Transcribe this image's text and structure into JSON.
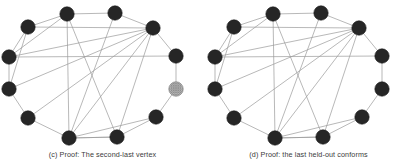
{
  "figure": {
    "type": "graph-pair-diagram",
    "background_color": "#ffffff",
    "panel_count": 2
  },
  "style": {
    "node_fill": "#262626",
    "node_stroke": "#1a1a1a",
    "highlight_node_fill": "#b5b5b5",
    "highlight_node_stroke": "#8c8c8c",
    "edge_color": "#9a9a9a",
    "edge_width": 0.7,
    "node_radius": 7.2,
    "caption_color": "#3b3b3b"
  },
  "panels": [
    {
      "id": "panel-c",
      "caption": "(c) Proof: The second-last vertex",
      "highlight_node_index": 9,
      "node_labels": [
        "v1",
        "v2",
        "v3",
        "v4",
        "v5",
        "v6",
        "v7",
        "v8",
        "v9",
        "v10",
        "v11",
        "v12"
      ],
      "nodes": [
        {
          "id": 0,
          "x": 67,
          "y": 14,
          "state": "dark"
        },
        {
          "id": 1,
          "x": 115,
          "y": 13,
          "state": "dark"
        },
        {
          "id": 2,
          "x": 153,
          "y": 28,
          "state": "dark"
        },
        {
          "id": 3,
          "x": 176,
          "y": 56,
          "state": "dark"
        },
        {
          "id": 4,
          "x": 176,
          "y": 89,
          "state": "highlight"
        },
        {
          "id": 5,
          "x": 156,
          "y": 117,
          "state": "dark"
        },
        {
          "id": 6,
          "x": 117,
          "y": 137,
          "state": "dark"
        },
        {
          "id": 7,
          "x": 69,
          "y": 138,
          "state": "dark"
        },
        {
          "id": 8,
          "x": 28,
          "y": 118,
          "state": "dark"
        },
        {
          "id": 9,
          "x": 9,
          "y": 89,
          "state": "dark"
        },
        {
          "id": 10,
          "x": 9,
          "y": 57,
          "state": "dark"
        },
        {
          "id": 11,
          "x": 28,
          "y": 27,
          "state": "dark"
        }
      ],
      "edges": [
        [
          0,
          1
        ],
        [
          1,
          2
        ],
        [
          2,
          3
        ],
        [
          3,
          4
        ],
        [
          4,
          5
        ],
        [
          5,
          6
        ],
        [
          6,
          7
        ],
        [
          7,
          8
        ],
        [
          8,
          9
        ],
        [
          9,
          10
        ],
        [
          10,
          11
        ],
        [
          11,
          0
        ],
        [
          0,
          7
        ],
        [
          0,
          10
        ],
        [
          1,
          7
        ],
        [
          2,
          7
        ],
        [
          2,
          9
        ],
        [
          2,
          10
        ],
        [
          2,
          11
        ],
        [
          3,
          10
        ],
        [
          5,
          7
        ],
        [
          6,
          7
        ],
        [
          6,
          2
        ],
        [
          8,
          2
        ],
        [
          11,
          9
        ],
        [
          0,
          6
        ]
      ]
    },
    {
      "id": "panel-d",
      "caption": "(d) Proof: the last held-out conforms",
      "highlight_node_index": null,
      "node_labels": [
        "v1",
        "v2",
        "v3",
        "v4",
        "v5",
        "v6",
        "v7",
        "v8",
        "v9",
        "v10",
        "v11",
        "v12"
      ],
      "nodes": [
        {
          "id": 0,
          "x": 67,
          "y": 14,
          "state": "dark"
        },
        {
          "id": 1,
          "x": 115,
          "y": 13,
          "state": "dark"
        },
        {
          "id": 2,
          "x": 153,
          "y": 28,
          "state": "dark"
        },
        {
          "id": 3,
          "x": 176,
          "y": 56,
          "state": "dark"
        },
        {
          "id": 4,
          "x": 176,
          "y": 89,
          "state": "dark"
        },
        {
          "id": 5,
          "x": 156,
          "y": 117,
          "state": "dark"
        },
        {
          "id": 6,
          "x": 117,
          "y": 137,
          "state": "dark"
        },
        {
          "id": 7,
          "x": 69,
          "y": 138,
          "state": "dark"
        },
        {
          "id": 8,
          "x": 28,
          "y": 118,
          "state": "dark"
        },
        {
          "id": 9,
          "x": 9,
          "y": 89,
          "state": "dark"
        },
        {
          "id": 10,
          "x": 9,
          "y": 57,
          "state": "dark"
        },
        {
          "id": 11,
          "x": 28,
          "y": 27,
          "state": "dark"
        }
      ],
      "edges": [
        [
          0,
          1
        ],
        [
          1,
          2
        ],
        [
          2,
          3
        ],
        [
          3,
          4
        ],
        [
          4,
          5
        ],
        [
          5,
          6
        ],
        [
          6,
          7
        ],
        [
          7,
          8
        ],
        [
          8,
          9
        ],
        [
          9,
          10
        ],
        [
          10,
          11
        ],
        [
          11,
          0
        ],
        [
          0,
          7
        ],
        [
          0,
          10
        ],
        [
          1,
          7
        ],
        [
          2,
          7
        ],
        [
          2,
          9
        ],
        [
          2,
          10
        ],
        [
          2,
          11
        ],
        [
          3,
          10
        ],
        [
          5,
          7
        ],
        [
          6,
          7
        ],
        [
          6,
          2
        ],
        [
          8,
          2
        ],
        [
          11,
          9
        ],
        [
          0,
          6
        ]
      ]
    }
  ]
}
